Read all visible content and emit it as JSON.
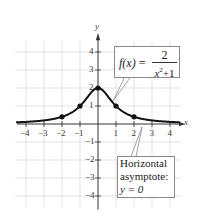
{
  "chart_data": {
    "type": "line",
    "title": "",
    "function": "f(x) = 2/(x^2+1)",
    "xlabel": "x",
    "ylabel": "y",
    "xlim": [
      -4.5,
      4.7
    ],
    "ylim": [
      -4.5,
      5
    ],
    "grid": true,
    "x_ticks": [
      -4,
      -3,
      -2,
      -1,
      1,
      2,
      3,
      4
    ],
    "y_ticks": [
      -4,
      -3,
      -2,
      -1,
      1,
      2,
      3,
      4
    ],
    "series": [
      {
        "name": "f(x) = 2/(x^2+1)",
        "marked_points": [
          {
            "x": -2,
            "y": 0.4
          },
          {
            "x": -1,
            "y": 1
          },
          {
            "x": 0,
            "y": 2
          },
          {
            "x": 1,
            "y": 1
          },
          {
            "x": 2,
            "y": 0.4
          }
        ]
      }
    ],
    "annotations": [
      {
        "text": "f(x) = 2 / (x^2+1)",
        "points_to": {
          "x": 0.85,
          "y": 1.35
        }
      },
      {
        "text": "Horizontal asymptote: y = 0",
        "points_to": {
          "x": 2.45,
          "y": 0
        }
      }
    ]
  },
  "axes": {
    "x_name": "x",
    "y_name": "y",
    "x_tick_labels": [
      "−4",
      "−3",
      "−2",
      "−1",
      "1",
      "2",
      "3",
      "4"
    ],
    "y_tick_labels_pos": [
      "1",
      "2",
      "3",
      "4"
    ],
    "y_tick_labels_neg": [
      "−1",
      "−2",
      "−3",
      "−4"
    ]
  },
  "callouts": {
    "function": {
      "lhs": "f(x)",
      "eq": " =",
      "numerator": "2",
      "den_var": "x",
      "den_exp": "2",
      "den_rest": "+1"
    },
    "asymptote": {
      "line1": "Horizontal",
      "line2": "asymptote:",
      "line3": "y = 0"
    }
  },
  "colors": {
    "grid": "#dcdcdc",
    "axis": "#333333",
    "curve": "#111111",
    "callout_border": "#8a8a8a"
  }
}
